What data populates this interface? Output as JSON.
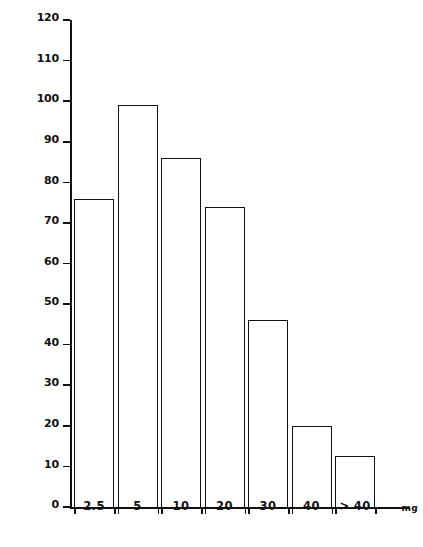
{
  "chart_data": {
    "type": "bar",
    "title": "",
    "xlabel": "",
    "ylabel": "Number of Patients",
    "unit_label": "mg",
    "categories": [
      "2.5",
      "5",
      "10",
      "20",
      "30",
      "40",
      "> 40"
    ],
    "values": [
      76,
      99,
      86,
      74,
      46,
      20,
      12.5
    ],
    "ylim": [
      0,
      120
    ],
    "ytick_labels": [
      "0",
      "10",
      "20",
      "30",
      "40",
      "50",
      "60",
      "70",
      "80",
      "90",
      "100",
      "110",
      "120"
    ],
    "ytick_values": [
      0,
      10,
      20,
      30,
      40,
      50,
      60,
      70,
      80,
      90,
      100,
      110,
      120
    ],
    "grid": false,
    "legend": null,
    "colors": {
      "ink": "#111111",
      "background": "#ffffff",
      "bar_fill": "transparent",
      "bar_stroke": "#111111"
    }
  }
}
